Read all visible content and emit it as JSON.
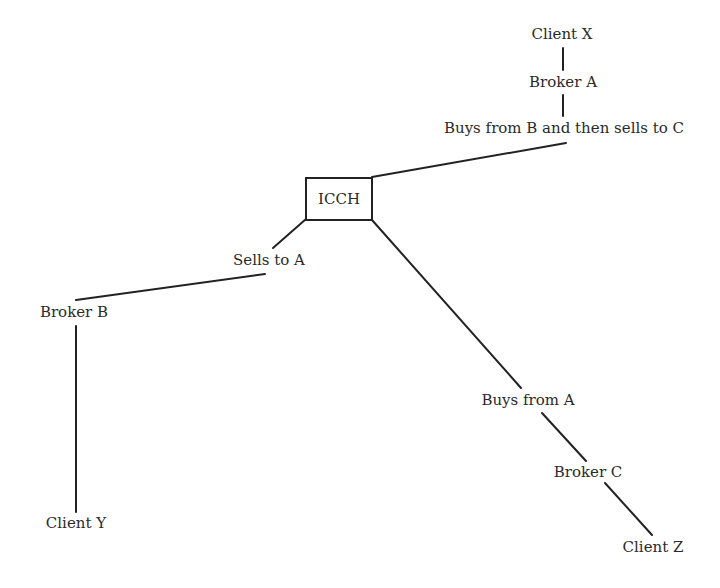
{
  "diagram": {
    "center": {
      "label": "ICCH"
    },
    "nodes": {
      "client_x": {
        "label": "Client X",
        "x": 562,
        "y": 27
      },
      "broker_a": {
        "label": "Broker A",
        "x": 563,
        "y": 75
      },
      "broker_a_action": {
        "label": "Buys from B and then sells to C",
        "x": 564,
        "y": 121
      },
      "broker_b_action": {
        "label": "Sells to A",
        "x": 269,
        "y": 253
      },
      "broker_b": {
        "label": "Broker B",
        "x": 74,
        "y": 305
      },
      "client_y": {
        "label": "Client Y",
        "x": 76,
        "y": 516
      },
      "broker_c_action": {
        "label": "Buys from A",
        "x": 528,
        "y": 393
      },
      "broker_c": {
        "label": "Broker C",
        "x": 588,
        "y": 465
      },
      "client_z": {
        "label": "Client Z",
        "x": 653,
        "y": 540
      }
    },
    "edges": [
      {
        "from": "client_x",
        "to": "broker_a"
      },
      {
        "from": "broker_a",
        "to": "broker_a_action"
      },
      {
        "from": "broker_a_action",
        "to": "ICCH"
      },
      {
        "from": "ICCH",
        "to": "broker_b_action"
      },
      {
        "from": "broker_b_action",
        "to": "broker_b"
      },
      {
        "from": "broker_b",
        "to": "client_y"
      },
      {
        "from": "ICCH",
        "to": "broker_c_action"
      },
      {
        "from": "broker_c_action",
        "to": "broker_c"
      },
      {
        "from": "broker_c",
        "to": "client_z"
      }
    ],
    "line_color": "#222222"
  }
}
